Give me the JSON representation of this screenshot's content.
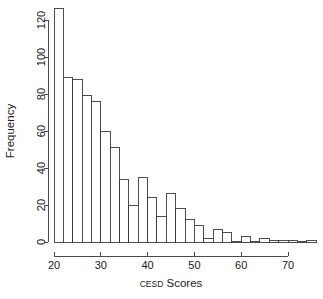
{
  "chart_data": {
    "type": "bar",
    "subtype": "histogram",
    "title": "",
    "xlabel": "CESD Scores",
    "xlabel_parts": {
      "small_caps": "CESD",
      "rest": " Scores"
    },
    "ylabel": "Frequency",
    "binwidth": 2,
    "bin_starts": [
      20,
      22,
      24,
      26,
      28,
      30,
      32,
      34,
      36,
      38,
      40,
      42,
      44,
      46,
      48,
      50,
      52,
      54,
      56,
      58,
      60,
      62,
      64,
      66,
      68,
      70,
      72,
      74
    ],
    "categories": [
      "20-22",
      "22-24",
      "24-26",
      "26-28",
      "28-30",
      "30-32",
      "32-34",
      "34-36",
      "36-38",
      "38-40",
      "40-42",
      "42-44",
      "44-46",
      "46-48",
      "48-50",
      "50-52",
      "52-54",
      "54-56",
      "56-58",
      "58-60",
      "60-62",
      "62-64",
      "64-66",
      "66-68",
      "68-70",
      "70-72",
      "72-74",
      "74-76"
    ],
    "values": [
      126,
      89,
      88,
      79,
      76,
      60,
      51,
      34,
      20,
      35,
      24,
      14,
      26,
      18,
      12,
      9,
      2,
      7,
      5,
      0,
      3,
      0,
      2,
      1,
      1,
      1,
      0,
      1
    ],
    "xlim": [
      20,
      76
    ],
    "ylim": [
      0,
      130
    ],
    "xticks": [
      20,
      30,
      40,
      50,
      60,
      70
    ],
    "yticks": [
      0,
      20,
      40,
      60,
      80,
      100,
      120
    ],
    "xtick_labels": [
      "20",
      "30",
      "40",
      "50",
      "60",
      "70"
    ],
    "ytick_labels": [
      "0",
      "20",
      "40",
      "60",
      "80",
      "100",
      "120"
    ],
    "grid": false,
    "legend": false,
    "bar_fill_color": "#ffffff",
    "bar_border_color": "#3a3a3a",
    "axis_color": "#4a4a4a",
    "background_color": "#ffffff"
  }
}
